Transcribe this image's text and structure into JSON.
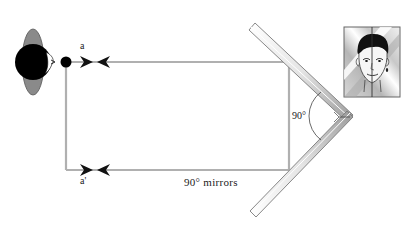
{
  "diagram": {
    "type": "ray diagram",
    "labels": {
      "ray_top": "a",
      "ray_bottom": "a'",
      "angle": "90°",
      "caption": "90°  mirrors"
    },
    "elements": [
      {
        "name": "observer-head",
        "description": "top view of head with eye"
      },
      {
        "name": "ray-a",
        "description": "light ray to/from upper mirror"
      },
      {
        "name": "ray-a-prime",
        "description": "light ray to/from lower mirror"
      },
      {
        "name": "upper-mirror",
        "description": "mirror angled at 45 degrees"
      },
      {
        "name": "lower-mirror",
        "description": "mirror angled at -45 degrees"
      },
      {
        "name": "reflected-face-image",
        "description": "face image seen in corner mirrors, non-reversed"
      }
    ],
    "colors": {
      "ray": "#b0b0b0",
      "head": "#000000",
      "ear": "#8a8a8a",
      "mirror_edge": "#8c8c8c",
      "mirror_fill": "#f2f2f2"
    }
  }
}
